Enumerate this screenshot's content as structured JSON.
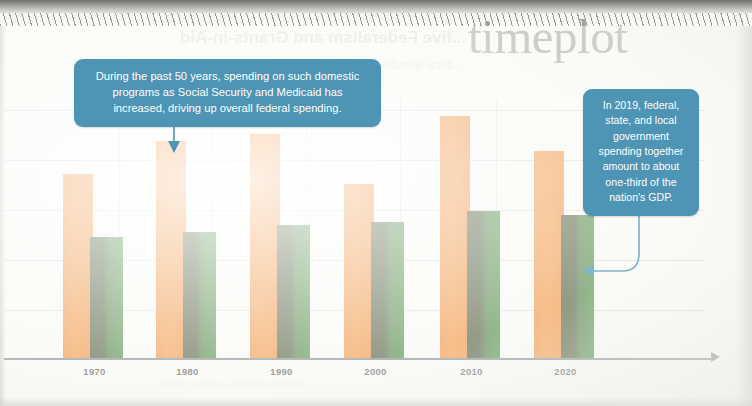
{
  "brand": {
    "name": "timeplot"
  },
  "ghost": {
    "title": "...tive Federalism and Grants-in-Aid",
    "subtitle": "...deral spending...",
    "lines": [
      "...nd state governments share the costs...",
      "...grants-in-aid to the states for programs...",
      "...categorical grants and block grants..."
    ]
  },
  "callouts": [
    {
      "name": "callout-spending",
      "text": "During the past 50 years, spending on such domestic programs as Social Security and Medicaid has increased, driving up overall federal spending.",
      "color": "#4e94b5"
    },
    {
      "name": "callout-gdp",
      "text": "In 2019, federal, state, and local government spending together amount to about one-third of the nation's GDP.",
      "color": "#4e94b5"
    }
  ],
  "chart_data": {
    "type": "bar",
    "title": "",
    "subtitle": "",
    "xlabel": "",
    "ylabel": "",
    "grid": true,
    "gridlines_y": [
      0,
      1,
      2,
      3,
      4,
      5
    ],
    "legend_position": "none",
    "categories": [
      "1970",
      "1980",
      "1990",
      "2000",
      "2010",
      "2020"
    ],
    "ylim": [
      0,
      3.6
    ],
    "series": [
      {
        "name": "Federal spending",
        "color": "#f07d22",
        "values": [
          2.6,
          3.05,
          3.15,
          2.45,
          3.4,
          2.92
        ]
      },
      {
        "name": "State and local spending",
        "color": "#2b7a24",
        "values": [
          1.72,
          1.78,
          1.88,
          1.92,
          2.08,
          2.02
        ]
      }
    ],
    "annotations": [
      {
        "name": "arrow-to-1980-bar",
        "target_category": "1980",
        "direction": "down"
      },
      {
        "name": "arrow-to-2020-green-bar",
        "target_category": "2020",
        "direction": "left"
      }
    ]
  },
  "axis": {
    "tick_labels": [
      "1970",
      "1980",
      "1990",
      "2000",
      "2010",
      "2020"
    ],
    "arrowhead": true,
    "color": "#6d7480"
  },
  "colors": {
    "orange": "#f07d22",
    "green": "#2b7a24",
    "callout_blue": "#4e94b5",
    "brand_gray": "#9ea398",
    "axis": "#6d7480",
    "grid": "#82879633",
    "page": "#fdfdfb"
  }
}
